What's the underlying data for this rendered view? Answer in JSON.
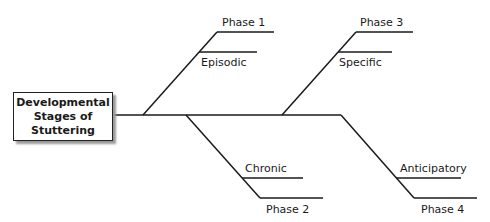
{
  "root": {
    "lines": [
      "Developmental",
      "Stages of",
      "Stuttering"
    ]
  },
  "branches": [
    {
      "phase": "Phase 1",
      "type": "Episodic"
    },
    {
      "phase": "Phase 2",
      "type": "Chronic"
    },
    {
      "phase": "Phase 3",
      "type": "Specific"
    },
    {
      "phase": "Phase 4",
      "type": "Anticipatory"
    }
  ],
  "colors": {
    "line": "#1a1a1a",
    "shadow": "#9a9a9a"
  }
}
